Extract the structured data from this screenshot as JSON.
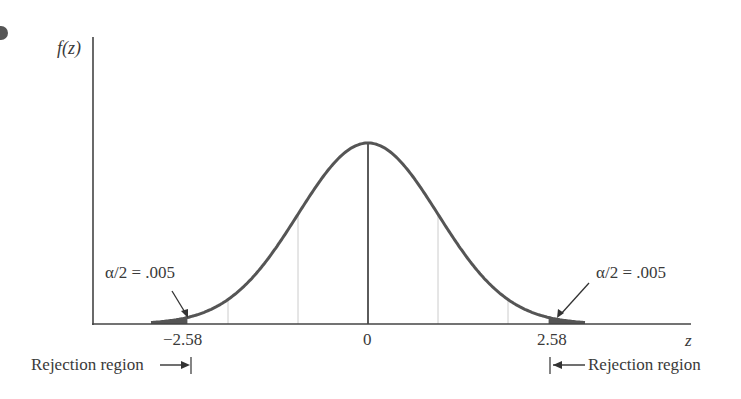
{
  "chart_data": {
    "type": "line",
    "title": "",
    "ylabel": "f(z)",
    "xlabel": "z",
    "distribution": "standard normal",
    "x_range": [
      -3.9,
      4.6
    ],
    "tick_labels": [
      "-2.58",
      "0",
      "2.58"
    ],
    "ticks": [
      -2.58,
      0,
      2.58
    ],
    "vertical_reference_lines": [
      -2,
      -1,
      0,
      1,
      2
    ],
    "shaded_regions": [
      {
        "from": -3.9,
        "to": -2.58,
        "label": "Rejection region",
        "area": 0.005
      },
      {
        "from": 2.58,
        "to": 3.9,
        "label": "Rejection region",
        "area": 0.005
      }
    ],
    "annotations": [
      {
        "text": "α/2 = .005",
        "points_to": -2.58
      },
      {
        "text": "α/2 = .005",
        "points_to": 2.58
      }
    ],
    "grid": false,
    "legend": null
  },
  "labels": {
    "y_axis": "f(z)",
    "x_axis": "z",
    "tick_left": "−2.58",
    "tick_center": "0",
    "tick_right": "2.58",
    "alpha_left": "α/2 = .005",
    "alpha_right": "α/2 = .005",
    "rejection_left": "Rejection region",
    "rejection_right": "Rejection region"
  },
  "colors": {
    "curve": "#555555",
    "axis": "#444444",
    "shade": "#555555",
    "gridline": "#cccccc"
  }
}
